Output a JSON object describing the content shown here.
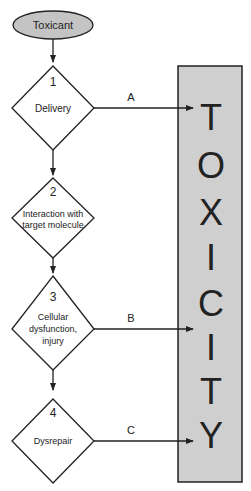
{
  "start": {
    "label": "Toxicant"
  },
  "steps": [
    {
      "number": "1",
      "lines": [
        "Delivery"
      ]
    },
    {
      "number": "2",
      "lines": [
        "Interaction with",
        "target molecule"
      ]
    },
    {
      "number": "3",
      "lines": [
        "Cellular",
        "dysfunction,",
        "injury"
      ]
    },
    {
      "number": "4",
      "lines": [
        "Dysrepair"
      ]
    }
  ],
  "arrows": [
    {
      "from_step": "1",
      "label": "A"
    },
    {
      "from_step": "3",
      "label": "B"
    },
    {
      "from_step": "4",
      "label": "C"
    }
  ],
  "outcome": {
    "letters": [
      "T",
      "O",
      "X",
      "I",
      "C",
      "I",
      "T",
      "Y"
    ],
    "fill": "#cfcfcf"
  }
}
